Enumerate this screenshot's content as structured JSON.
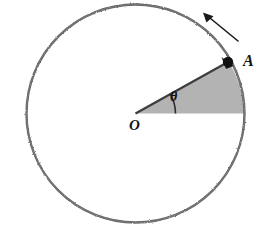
{
  "figure": {
    "background_color": "#ffffff",
    "stroke_color": "#4a4a4a",
    "dark_stroke_color": "#262626",
    "sector_fill_color": "#b3b3b3",
    "point_color": "#111111",
    "labels": {
      "point_a": "A",
      "origin": "O",
      "angle": "θ"
    },
    "geometry": {
      "center": {
        "x": 135.5,
        "y": 113.5,
        "name": "O"
      },
      "radius": 109,
      "point_a": {
        "x": 228,
        "y": 62,
        "angle_deg": 29
      },
      "axis_point_right": {
        "x": 244.5,
        "y": 113.5,
        "angle_deg": 0
      },
      "angle_arc_radius": 40,
      "horizontal_axis": {
        "x_start": 6,
        "x_end": 263,
        "y": 113.5
      },
      "rotation_arrow": {
        "from": {
          "x": 238,
          "y": 41
        },
        "to": {
          "x": 204,
          "y": 13
        },
        "direction": "counterclockwise"
      }
    }
  }
}
